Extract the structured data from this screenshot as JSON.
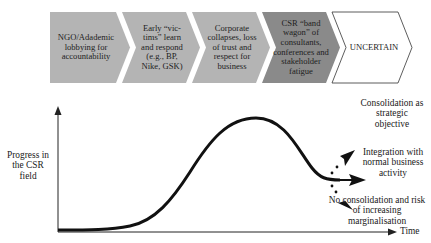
{
  "stages": [
    {
      "label": "NGO/Adademic lobbying for accountability",
      "fill": "#b4b4b4"
    },
    {
      "label": "Early “vic-tims” learn and respond (e.g., BP, Nike, GSK)",
      "fill": "#b4b4b4"
    },
    {
      "label": "Corporate collapses, loss of trust and respect for business",
      "fill": "#b4b4b4"
    },
    {
      "label": "CSR “band wagon” of consultants, conferences and stakeholder fatigue",
      "fill": "#8a8a8a"
    },
    {
      "label": "UNCERTAIN",
      "fill": "#ffffff"
    }
  ],
  "axes": {
    "y_label": "Progress in the CSR field",
    "x_label": "Time"
  },
  "outcomes": [
    {
      "label": "Consolidation as strategic objective",
      "direction": "up"
    },
    {
      "label": "Integration with normal business activity",
      "direction": "straight"
    },
    {
      "label": "No consolidation and risk of increasing marginalisation",
      "direction": "down"
    }
  ],
  "colors": {
    "stage_gray": "#b4b4b4",
    "stage_dark": "#8a8a8a",
    "curve": "#111111"
  }
}
